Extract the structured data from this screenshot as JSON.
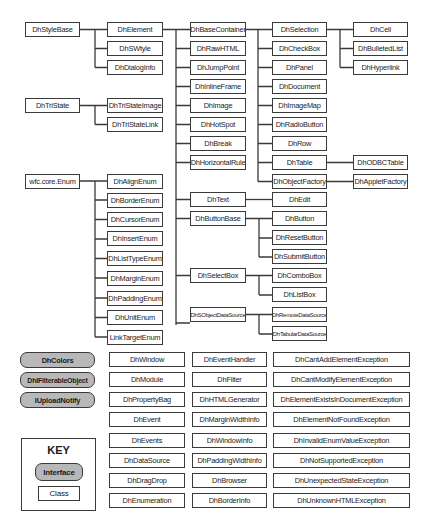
{
  "diagram": {
    "title": "",
    "groups": {
      "style_base": {
        "root": "DhStyleBase",
        "children": [
          "DhElement",
          "DhSWtyle",
          "DhDialogInfo"
        ]
      },
      "element": {
        "root": "DhElement",
        "children": [
          "DhBaseContainer",
          "DhRawHTML",
          "DhJumpPoint",
          "DhInlineFrame",
          "DhImage",
          "DhHotSpot",
          "DhBreak",
          "DhHorizontalRule",
          "DhText",
          "DhButtonBase",
          "DhSelectBox",
          "DhSObjectDataSource"
        ]
      },
      "base_container": {
        "root": "DhBaseContainer",
        "children": [
          "DhSelection",
          "DhCheckBox",
          "DhPanel",
          "DhDocument",
          "DhImageMap",
          "DhRadioButton",
          "DhRow",
          "DhTable",
          "DhObjectFactory"
        ]
      },
      "selection": {
        "root": "DhSelection",
        "children": [
          "DhCell",
          "DhBulletedList",
          "DhHyperlink"
        ]
      },
      "table": {
        "root": "DhTable",
        "children": [
          "DhODBCTable"
        ]
      },
      "object_factory": {
        "root": "DhObjectFactory",
        "children": [
          "DhAppletFactory"
        ]
      },
      "text": {
        "root": "DhText",
        "children": [
          "DhEdit"
        ]
      },
      "button_base": {
        "root": "DhButtonBase",
        "children": [
          "DhButton",
          "DhResetButton",
          "DhSubmitButton"
        ]
      },
      "select_box": {
        "root": "DhSelectBox",
        "children": [
          "DhComboBox",
          "DhListBox"
        ]
      },
      "data_source": {
        "root": "DhSObjectDataSource",
        "children": [
          "DhRemoteDataSource",
          "DhTabularDataSource"
        ]
      },
      "tri_state": {
        "root": "DhTriState",
        "children": [
          "DhTriStateImage",
          "DhTriStateLink"
        ]
      },
      "enum": {
        "root": "wfc.core.Enum",
        "children": [
          "DhAlignEnum",
          "DhBorderEnum",
          "DhCursorEnum",
          "DhInsertEnum",
          "DhListTypeEnum",
          "DhMarginEnum",
          "DhPaddingEnum",
          "DhUnitEnum",
          "LinkTargetEnum"
        ]
      }
    },
    "interfaces": [
      "DhColors",
      "DhIFilterableObject",
      "IUploadNotify"
    ],
    "standalone_col1": [
      "DhWindow",
      "DhModule",
      "DhPropertyBag",
      "DhEvent",
      "DhEvents",
      "DhDataSource",
      "DhDragDrop",
      "DhEnumeration"
    ],
    "standalone_col2": [
      "DhEventHandler",
      "DhFilter",
      "DhHTMLGenerator",
      "DhMarginWidthInfo",
      "DhWindowInfo",
      "DhPaddingWidthInfo",
      "DhBrowser",
      "DhBorderInfo"
    ],
    "exceptions": [
      "DhCantAddElementException",
      "DhCantModifyElementException",
      "DhElementExistsInDocumentException",
      "DhElementNotFoundException",
      "DhInvalidEnumValueException",
      "DhNotSupportedException",
      "DhUnexpectedStateException",
      "DhUnknownHTMLException"
    ],
    "key": {
      "title": "KEY",
      "interface_label": "Interface",
      "class_label": "Class"
    },
    "colors": {
      "interface_fill": "#b8b8b8",
      "border": "#3a3a3a",
      "background": "#ffffff"
    }
  }
}
